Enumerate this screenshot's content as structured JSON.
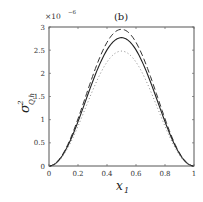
{
  "chart_data": {
    "type": "line",
    "title": "(b)",
    "xlabel": "x",
    "xlabel_sub": "1",
    "ylabel": "σ",
    "ylabel_sup": "2",
    "ylabel_sub": "Q,h",
    "y_multiplier": "×10",
    "y_multiplier_exp": "−6",
    "xlim": [
      0,
      1
    ],
    "ylim": [
      0,
      3
    ],
    "xticks": [
      0,
      0.2,
      0.4,
      0.6,
      0.8,
      1
    ],
    "xtick_labels": [
      "0",
      "0.2",
      "0.4",
      "0.6",
      "0.8",
      "1"
    ],
    "yticks": [
      0,
      0.5,
      1,
      1.5,
      2,
      2.5,
      3
    ],
    "ytick_labels": [
      "0",
      "0.5",
      "1",
      "1.5",
      "2",
      "2.5",
      "3"
    ],
    "grid": false,
    "legend": "none",
    "x": [
      0,
      0.1,
      0.2,
      0.3,
      0.4,
      0.5,
      0.6,
      0.7,
      0.8,
      0.9,
      1
    ],
    "series": [
      {
        "name": "dashed",
        "style": "dashed",
        "values": [
          0,
          0.27,
          0.99,
          1.94,
          2.68,
          2.95,
          2.68,
          1.94,
          0.99,
          0.27,
          0
        ]
      },
      {
        "name": "solid",
        "style": "solid",
        "values": [
          0,
          0.25,
          0.95,
          1.84,
          2.52,
          2.77,
          2.52,
          1.84,
          0.95,
          0.25,
          0
        ]
      },
      {
        "name": "dotted",
        "style": "dotted",
        "values": [
          0,
          0.22,
          0.85,
          1.65,
          2.25,
          2.48,
          2.25,
          1.65,
          0.85,
          0.22,
          0
        ]
      }
    ],
    "peak_model": {
      "dashed": 2.95,
      "solid": 2.77,
      "dotted": 2.48
    }
  }
}
